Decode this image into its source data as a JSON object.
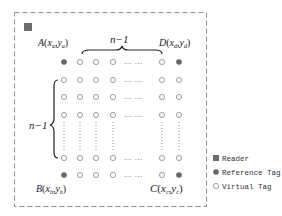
{
  "diagram": {
    "corners": {
      "A": {
        "letter": "A",
        "sub_x": "a",
        "sub_y": "a"
      },
      "B": {
        "letter": "B",
        "sub_x": "b",
        "sub_y": "b"
      },
      "C": {
        "letter": "C",
        "sub_x": "c",
        "sub_y": "c"
      },
      "D": {
        "letter": "D",
        "sub_x": "d",
        "sub_y": "d"
      }
    },
    "top_brace_label": "n−1",
    "left_brace_label": "n−1",
    "ellipsis": "… …"
  },
  "legend": {
    "items": [
      {
        "icon": "reader-square-icon",
        "label": "Reader"
      },
      {
        "icon": "reference-tag-dot-icon",
        "label": "Reference Tag"
      },
      {
        "icon": "virtual-tag-circle-icon",
        "label": "Virtual Tag"
      }
    ]
  },
  "colors": {
    "reader": "#6b6b6b",
    "reference": "#666666",
    "virtual_stroke": "#888888",
    "border": "#777777"
  }
}
